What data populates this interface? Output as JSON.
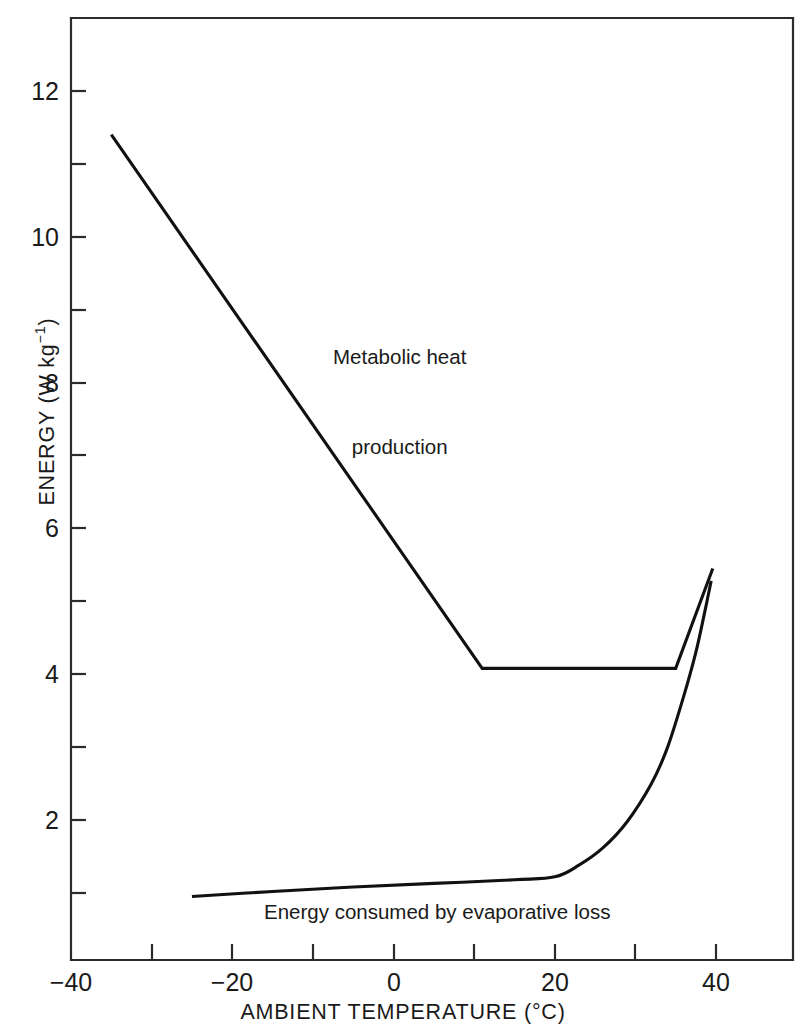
{
  "chart_data": {
    "type": "line",
    "title": "",
    "subtitle": "",
    "xlabel": "AMBIENT TEMPERATURE (°C)",
    "ylabel": "ENERGY (W kg⁻¹)",
    "ylabel_main": "ENERGY (W kg",
    "ylabel_exp": "−1",
    "ylabel_tail": ")",
    "xlabel_main": "AMBIENT TEMPERATURE (",
    "xlabel_unit": "°C)",
    "xlim": [
      -40,
      46
    ],
    "ylim": [
      0.1,
      13.0
    ],
    "grid": false,
    "legend_position": "inline-annotations",
    "x_major_ticks": [
      -40,
      -20,
      0,
      20,
      40
    ],
    "x_major_tick_labels": [
      "−40",
      "−20",
      "0",
      "20",
      "40"
    ],
    "x_minor_ticks": [
      -30,
      -10,
      10,
      30
    ],
    "y_major_ticks": [
      2,
      4,
      6,
      8,
      10,
      12
    ],
    "y_major_tick_labels": [
      "2",
      "4",
      "6",
      "8",
      "10",
      "12"
    ],
    "y_minor_ticks": [
      1,
      3,
      5,
      7,
      9,
      11
    ],
    "series": [
      {
        "name": "Metabolic heat production",
        "annotation": "Metabolic heat\nproduction",
        "annotation_line1": "Metabolic heat",
        "annotation_line2": "production",
        "color": "#111111",
        "points": [
          [
            -35.0,
            11.4
          ],
          [
            11.0,
            4.08
          ],
          [
            35.0,
            4.08
          ],
          [
            39.6,
            5.45
          ]
        ]
      },
      {
        "name": "Energy consumed by evaporative loss",
        "annotation": "Energy consumed by evaporative loss",
        "annotation_line1": "Energy consumed by evaporative loss",
        "color": "#111111",
        "points": [
          [
            -25.0,
            0.95
          ],
          [
            -15.0,
            1.02
          ],
          [
            -5.0,
            1.08
          ],
          [
            5.0,
            1.13
          ],
          [
            15.0,
            1.18
          ],
          [
            20.0,
            1.22
          ],
          [
            23.0,
            1.38
          ],
          [
            26.0,
            1.62
          ],
          [
            29.0,
            1.98
          ],
          [
            32.0,
            2.5
          ],
          [
            34.0,
            3.0
          ],
          [
            36.0,
            3.7
          ],
          [
            37.5,
            4.3
          ],
          [
            38.5,
            4.8
          ],
          [
            39.4,
            5.28
          ]
        ]
      }
    ]
  },
  "axes": {
    "x_tick_labels": [
      "−40",
      "−20",
      "0",
      "20",
      "40"
    ],
    "y_tick_labels": [
      "2",
      "4",
      "6",
      "8",
      "10",
      "12"
    ]
  },
  "annotations": {
    "metabolic_line1": "Metabolic heat",
    "metabolic_line2": "production",
    "evaporative": "Energy consumed by evaporative loss"
  },
  "colors": {
    "line": "#111111",
    "axis": "#2b2b2b",
    "text": "#1a1a1a",
    "background": "#ffffff"
  }
}
